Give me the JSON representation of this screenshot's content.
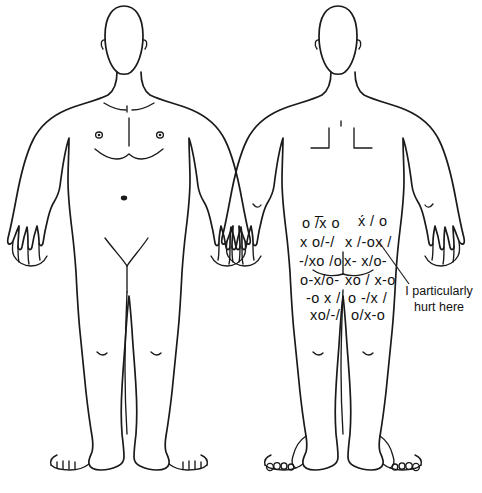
{
  "document": {
    "type": "pain-drawing-body-chart",
    "background_color": "#ffffff",
    "ink_color": "#1a1a1a",
    "views": [
      {
        "id": "anterior",
        "label": "front view",
        "position": "left"
      },
      {
        "id": "posterior",
        "label": "back view",
        "position": "right"
      }
    ]
  },
  "annotation": {
    "line1": "I particularly",
    "line2": "hurt here",
    "full_text": "I particularly hurt here",
    "leader_line": "diagonal line from marked region to text"
  },
  "pain_markings": {
    "region": "lower back, buttocks and upper posterior thighs",
    "symbols_used": [
      "o",
      "x",
      "/",
      "-"
    ],
    "rows": [
      {
        "left": "o /̅x o",
        "right": "x́ / o"
      },
      {
        "left": "x o/-/",
        "right": "x /-ox /"
      },
      {
        "left": "-/xo /o",
        "right": "x- x/o-"
      },
      {
        "left": "o-x/o-",
        "right": "xo / x-o"
      },
      {
        "left": "-o x /",
        "right": "o -/x /"
      },
      {
        "left": "xo/-/",
        "right": "o/x-o"
      }
    ]
  },
  "anatomy_details": {
    "front": [
      "head",
      "ears",
      "neck",
      "clavicles",
      "nipples",
      "pectoral line",
      "navel",
      "hands",
      "feet with toes"
    ],
    "back": [
      "head",
      "ears",
      "neck",
      "scapula marks",
      "elbows",
      "gluteal cleft",
      "heels",
      "toes"
    ]
  }
}
